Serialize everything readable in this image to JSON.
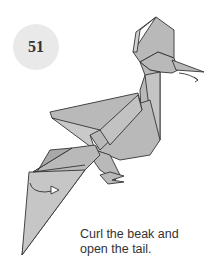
{
  "step": {
    "number": "51"
  },
  "caption": {
    "line1": "Curl the beak and",
    "line2": "open the tail."
  },
  "colors": {
    "paper": "#b9b9b9",
    "outline": "#333333",
    "badge": "#e9e9e9"
  },
  "icons": [
    "curl-arrow-icon",
    "open-arrow-icon"
  ]
}
